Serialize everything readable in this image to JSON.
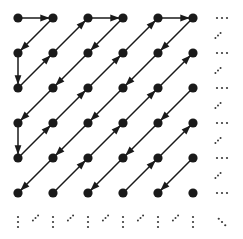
{
  "figure": {
    "type": "lattice-diagram",
    "background_color": "#ffffff",
    "node_color": "#1a1a1a",
    "edge_color": "#1a1a1a",
    "ellipsis_color": "#3a3a3a"
  },
  "grid": {
    "columns": 6,
    "rows": 6,
    "origin_x": 18,
    "origin_y": 18,
    "spacing_x": 35,
    "spacing_y": 35,
    "node_radius": 4.6,
    "column_positions": [
      18,
      53,
      88,
      123,
      158,
      193
    ],
    "row_positions": [
      18,
      53,
      88,
      123,
      158,
      193
    ]
  },
  "nodes": [
    {
      "col": 0,
      "row": 0
    },
    {
      "col": 1,
      "row": 0
    },
    {
      "col": 2,
      "row": 0
    },
    {
      "col": 3,
      "row": 0
    },
    {
      "col": 4,
      "row": 0
    },
    {
      "col": 5,
      "row": 0
    },
    {
      "col": 0,
      "row": 1
    },
    {
      "col": 1,
      "row": 1
    },
    {
      "col": 2,
      "row": 1
    },
    {
      "col": 3,
      "row": 1
    },
    {
      "col": 4,
      "row": 1
    },
    {
      "col": 5,
      "row": 1
    },
    {
      "col": 0,
      "row": 2
    },
    {
      "col": 1,
      "row": 2
    },
    {
      "col": 2,
      "row": 2
    },
    {
      "col": 3,
      "row": 2
    },
    {
      "col": 4,
      "row": 2
    },
    {
      "col": 5,
      "row": 2
    },
    {
      "col": 0,
      "row": 3
    },
    {
      "col": 1,
      "row": 3
    },
    {
      "col": 2,
      "row": 3
    },
    {
      "col": 3,
      "row": 3
    },
    {
      "col": 4,
      "row": 3
    },
    {
      "col": 5,
      "row": 3
    },
    {
      "col": 0,
      "row": 4
    },
    {
      "col": 1,
      "row": 4
    },
    {
      "col": 2,
      "row": 4
    },
    {
      "col": 3,
      "row": 4
    },
    {
      "col": 4,
      "row": 4
    },
    {
      "col": 5,
      "row": 4
    },
    {
      "col": 0,
      "row": 5
    },
    {
      "col": 1,
      "row": 5
    },
    {
      "col": 2,
      "row": 5
    },
    {
      "col": 3,
      "row": 5
    },
    {
      "col": 4,
      "row": 5
    },
    {
      "col": 5,
      "row": 5
    }
  ],
  "arrows": [
    {
      "kind": "horizontal-right",
      "from": {
        "col": 0,
        "row": 0
      },
      "to": {
        "col": 1,
        "row": 0
      }
    },
    {
      "kind": "horizontal-right",
      "from": {
        "col": 2,
        "row": 0
      },
      "to": {
        "col": 3,
        "row": 0
      }
    },
    {
      "kind": "horizontal-right",
      "from": {
        "col": 4,
        "row": 0
      },
      "to": {
        "col": 5,
        "row": 0
      }
    },
    {
      "kind": "vertical-down",
      "from": {
        "col": 0,
        "row": 1
      },
      "to": {
        "col": 0,
        "row": 2
      }
    },
    {
      "kind": "vertical-down",
      "from": {
        "col": 0,
        "row": 3
      },
      "to": {
        "col": 0,
        "row": 4
      }
    },
    {
      "kind": "diagonal-down-left",
      "from": {
        "col": 1,
        "row": 0
      },
      "to": {
        "col": 0,
        "row": 1
      }
    },
    {
      "kind": "diagonal-down-left",
      "from": {
        "col": 3,
        "row": 0
      },
      "to": {
        "col": 2,
        "row": 1
      }
    },
    {
      "kind": "diagonal-down-left",
      "from": {
        "col": 2,
        "row": 1
      },
      "to": {
        "col": 1,
        "row": 2
      }
    },
    {
      "kind": "diagonal-down-left",
      "from": {
        "col": 1,
        "row": 2
      },
      "to": {
        "col": 0,
        "row": 3
      }
    },
    {
      "kind": "diagonal-down-left",
      "from": {
        "col": 5,
        "row": 0
      },
      "to": {
        "col": 4,
        "row": 1
      }
    },
    {
      "kind": "diagonal-down-left",
      "from": {
        "col": 4,
        "row": 1
      },
      "to": {
        "col": 3,
        "row": 2
      }
    },
    {
      "kind": "diagonal-down-left",
      "from": {
        "col": 3,
        "row": 2
      },
      "to": {
        "col": 2,
        "row": 3
      }
    },
    {
      "kind": "diagonal-down-left",
      "from": {
        "col": 2,
        "row": 3
      },
      "to": {
        "col": 1,
        "row": 4
      }
    },
    {
      "kind": "diagonal-down-left",
      "from": {
        "col": 1,
        "row": 4
      },
      "to": {
        "col": 0,
        "row": 5
      }
    },
    {
      "kind": "diagonal-down-left",
      "from": {
        "col": 5,
        "row": 2
      },
      "to": {
        "col": 4,
        "row": 3
      }
    },
    {
      "kind": "diagonal-down-left",
      "from": {
        "col": 4,
        "row": 3
      },
      "to": {
        "col": 3,
        "row": 4
      }
    },
    {
      "kind": "diagonal-down-left",
      "from": {
        "col": 3,
        "row": 4
      },
      "to": {
        "col": 2,
        "row": 5
      }
    },
    {
      "kind": "diagonal-down-left",
      "from": {
        "col": 5,
        "row": 4
      },
      "to": {
        "col": 4,
        "row": 5
      }
    },
    {
      "kind": "diagonal-up-right",
      "from": {
        "col": 0,
        "row": 2
      },
      "to": {
        "col": 1,
        "row": 1
      }
    },
    {
      "kind": "diagonal-up-right",
      "from": {
        "col": 1,
        "row": 1
      },
      "to": {
        "col": 2,
        "row": 0
      }
    },
    {
      "kind": "diagonal-up-right",
      "from": {
        "col": 0,
        "row": 4
      },
      "to": {
        "col": 1,
        "row": 3
      }
    },
    {
      "kind": "diagonal-up-right",
      "from": {
        "col": 1,
        "row": 3
      },
      "to": {
        "col": 2,
        "row": 2
      }
    },
    {
      "kind": "diagonal-up-right",
      "from": {
        "col": 2,
        "row": 2
      },
      "to": {
        "col": 3,
        "row": 1
      }
    },
    {
      "kind": "diagonal-up-right",
      "from": {
        "col": 3,
        "row": 1
      },
      "to": {
        "col": 4,
        "row": 0
      }
    },
    {
      "kind": "diagonal-up-right",
      "from": {
        "col": 1,
        "row": 5
      },
      "to": {
        "col": 2,
        "row": 4
      }
    },
    {
      "kind": "diagonal-up-right",
      "from": {
        "col": 2,
        "row": 4
      },
      "to": {
        "col": 3,
        "row": 3
      }
    },
    {
      "kind": "diagonal-up-right",
      "from": {
        "col": 3,
        "row": 3
      },
      "to": {
        "col": 4,
        "row": 2
      }
    },
    {
      "kind": "diagonal-up-right",
      "from": {
        "col": 4,
        "row": 2
      },
      "to": {
        "col": 5,
        "row": 1
      }
    },
    {
      "kind": "diagonal-up-right",
      "from": {
        "col": 3,
        "row": 5
      },
      "to": {
        "col": 4,
        "row": 4
      }
    },
    {
      "kind": "diagonal-up-right",
      "from": {
        "col": 4,
        "row": 4
      },
      "to": {
        "col": 5,
        "row": 3
      }
    }
  ],
  "ellipses": {
    "right_horizontal": {
      "glyph": "...",
      "x": 222,
      "rows": [
        0,
        1,
        2,
        3,
        4,
        5
      ],
      "dot_count": 3,
      "dot_spacing": 5,
      "dot_radius": 1.1
    },
    "right_diagonal": {
      "glyph": "..",
      "x": 218,
      "between_rows": [
        0,
        1,
        2,
        3,
        4
      ],
      "dot_count": 3,
      "dot_spacing": 3.6,
      "dot_radius": 1.0
    },
    "bottom_vertical": {
      "glyph": "vdots",
      "y": 222,
      "columns": [
        0,
        1,
        2,
        3,
        4,
        5
      ],
      "dot_count": 3,
      "dot_spacing": 5,
      "dot_radius": 1.1
    },
    "bottom_diagonal": {
      "glyph": "..",
      "y": 218,
      "between_columns": [
        0,
        1,
        2,
        3,
        4
      ],
      "dot_count": 3,
      "dot_spacing": 3.6,
      "dot_radius": 1.0
    },
    "corner_diagonal": {
      "glyph": "ddots",
      "x": 222,
      "y": 222,
      "dot_count": 3,
      "dot_spacing": 4.5,
      "dot_radius": 1.1
    }
  }
}
